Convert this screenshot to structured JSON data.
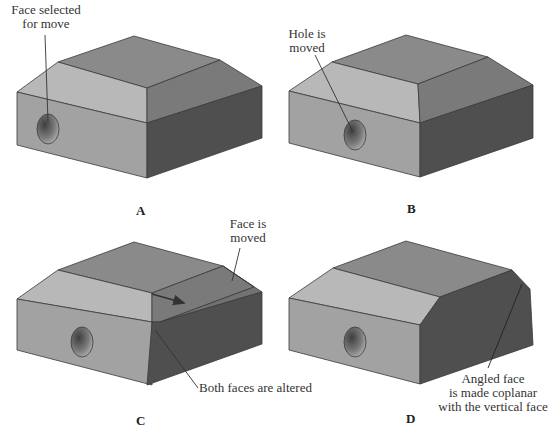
{
  "colors": {
    "top_face": "#8a8a8a",
    "chamfer_front": "#b8b8b8",
    "chamfer_right": "#7a7a7a",
    "front_face": "#a2a2a2",
    "right_face": "#4f4f4f",
    "edge": "#3a3a3a",
    "hole_dark": "#4a4a4a",
    "hole_light": "#b0b0b0"
  },
  "panels": [
    {
      "letter": "A",
      "callout": [
        "Face selected",
        "for move"
      ]
    },
    {
      "letter": "B",
      "callout": [
        "Hole is",
        "moved"
      ]
    },
    {
      "letter": "C",
      "callout": [
        "Face is",
        "moved"
      ],
      "callout2": "Both faces are altered"
    },
    {
      "letter": "D",
      "callout": [
        "Angled face",
        "is made coplanar",
        "with the vertical face"
      ]
    }
  ]
}
